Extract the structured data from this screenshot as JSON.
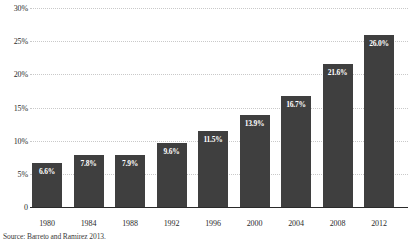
{
  "chart_data": {
    "type": "bar",
    "title": "",
    "xlabel": "",
    "ylabel": "",
    "categories": [
      "1980",
      "1984",
      "1988",
      "1992",
      "1996",
      "2000",
      "2004",
      "2008",
      "2012"
    ],
    "values": [
      6.6,
      7.8,
      7.9,
      9.6,
      11.5,
      13.9,
      16.7,
      21.6,
      26.0
    ],
    "value_labels": [
      "6.6%",
      "7.8%",
      "7.9%",
      "9.6%",
      "11.5%",
      "13.9%",
      "16.7%",
      "21.6%",
      "26.0%"
    ],
    "ylim": [
      0,
      30
    ],
    "yticks": [
      0,
      5,
      10,
      15,
      20,
      25,
      30
    ],
    "ytick_labels": [
      "0",
      "5%",
      "10%",
      "15%",
      "20%",
      "25%",
      "30%"
    ],
    "grid": true,
    "grid_style": "dotted",
    "legend": "none",
    "bar_color": "#3f3f3f",
    "value_label_color": "#ffffff",
    "gridline_color": "#c9c9c9",
    "axis_color": "#2a2a2a"
  },
  "source": {
    "text": "Source: Barreto and Ramirez 2013."
  }
}
